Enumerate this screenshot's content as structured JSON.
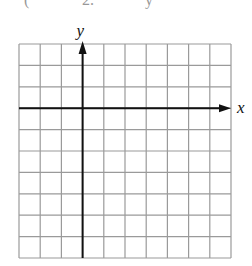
{
  "header_fragment": {
    "parts": [
      "(",
      "2.",
      "y"
    ]
  },
  "graph": {
    "x_axis_label": "x",
    "y_axis_label": "y",
    "grid": {
      "columns": 10,
      "rows": 10,
      "left": 19,
      "top": 44,
      "right": 231,
      "bottom": 258,
      "y_axis_column": 3,
      "x_axis_row": 3
    },
    "colors": {
      "grid_line": "#9a9a9a",
      "axis": "#111111",
      "background": "#ffffff"
    }
  }
}
